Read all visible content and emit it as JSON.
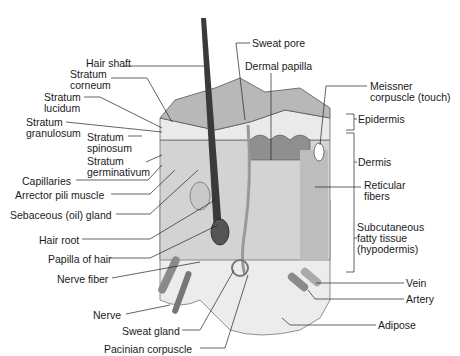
{
  "labels_left": [
    {
      "id": "hair-shaft",
      "text": "Hair shaft",
      "x": 86,
      "y": 62
    },
    {
      "id": "stratum-corneum-1",
      "text": "Stratum",
      "x": 70,
      "y": 73
    },
    {
      "id": "stratum-corneum-2",
      "text": "corneum",
      "x": 70,
      "y": 84
    },
    {
      "id": "stratum-lucidum-1",
      "text": "Stratum",
      "x": 44,
      "y": 92
    },
    {
      "id": "stratum-lucidum-2",
      "text": "lucidum",
      "x": 44,
      "y": 103
    },
    {
      "id": "stratum-granulosum-1",
      "text": "Stratum",
      "x": 26,
      "y": 117
    },
    {
      "id": "stratum-granulosum-2",
      "text": "granulosum",
      "x": 26,
      "y": 128
    },
    {
      "id": "stratum-spinosum-1",
      "text": "Stratum",
      "x": 87,
      "y": 132
    },
    {
      "id": "stratum-spinosum-2",
      "text": "spinosum",
      "x": 87,
      "y": 143
    },
    {
      "id": "stratum-germinativum-1",
      "text": "Stratum",
      "x": 87,
      "y": 156
    },
    {
      "id": "stratum-germinativum-2",
      "text": "germinativum",
      "x": 87,
      "y": 167
    },
    {
      "id": "capillaries",
      "text": "Capillaries",
      "x": 22,
      "y": 176
    },
    {
      "id": "arrector-pili",
      "text": "Arrector pili muscle",
      "x": 15,
      "y": 190
    },
    {
      "id": "sebaceous-gland",
      "text": "Sebaceous (oil) gland",
      "x": 10,
      "y": 210
    },
    {
      "id": "hair-root",
      "text": "Hair root",
      "x": 39,
      "y": 235
    },
    {
      "id": "papilla-of-hair",
      "text": "Papilla of hair",
      "x": 48,
      "y": 254
    },
    {
      "id": "nerve-fiber",
      "text": "Nerve fiber",
      "x": 57,
      "y": 274
    },
    {
      "id": "nerve",
      "text": "Nerve",
      "x": 93,
      "y": 310
    },
    {
      "id": "sweat-gland",
      "text": "Sweat gland",
      "x": 122,
      "y": 326
    },
    {
      "id": "pacinian-corpuscle",
      "text": "Pacinian corpuscle",
      "x": 104,
      "y": 344
    }
  ],
  "labels_right": [
    {
      "id": "sweat-pore",
      "text": "Sweat pore",
      "x": 252,
      "y": 39
    },
    {
      "id": "dermal-papilla",
      "text": "Dermal papilla",
      "x": 245,
      "y": 62
    },
    {
      "id": "meissner-1",
      "text": "Meissner",
      "x": 370,
      "y": 82
    },
    {
      "id": "meissner-2",
      "text": "corpuscle (touch)",
      "x": 370,
      "y": 93
    },
    {
      "id": "epidermis",
      "text": "Epidermis",
      "x": 357,
      "y": 115
    },
    {
      "id": "dermis",
      "text": "Dermis",
      "x": 357,
      "y": 158
    },
    {
      "id": "reticular-1",
      "text": "Reticular",
      "x": 364,
      "y": 181
    },
    {
      "id": "reticular-2",
      "text": "fibers",
      "x": 364,
      "y": 192
    },
    {
      "id": "subcutaneous-1",
      "text": "Subcutaneous",
      "x": 355,
      "y": 223
    },
    {
      "id": "subcutaneous-2",
      "text": "fatty tissue",
      "x": 355,
      "y": 234
    },
    {
      "id": "subcutaneous-3",
      "text": "(hypodermis)",
      "x": 355,
      "y": 245
    },
    {
      "id": "vein",
      "text": "Vein",
      "x": 406,
      "y": 279
    },
    {
      "id": "artery",
      "text": "Artery",
      "x": 406,
      "y": 295
    },
    {
      "id": "adipose",
      "text": "Adipose",
      "x": 378,
      "y": 321
    }
  ],
  "colors": {
    "ink": "#1a1a1a",
    "skin_top": "#b9b9b9",
    "epidermis": "#e6e6e6",
    "dermis": "#cfcfcf",
    "fat": "#ededed",
    "hair": "#3a3a3a",
    "vessel": "#8a8a8a"
  }
}
